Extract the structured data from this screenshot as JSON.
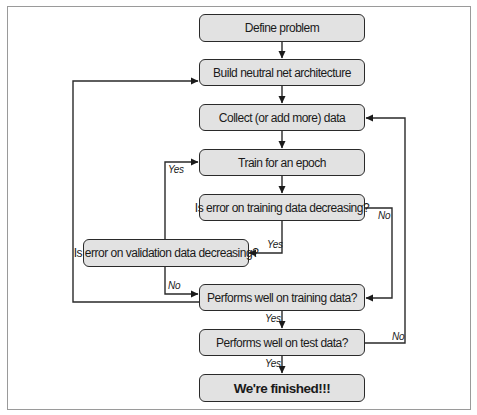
{
  "diagram": {
    "type": "flowchart",
    "nodes": {
      "define": "Define problem",
      "build": "Build neutral net architecture",
      "collect": "Collect (or add more) data",
      "train": "Train for an epoch",
      "train_err": "Is error on training data decreasing?",
      "val_err": "Is error on validation data decreasing?",
      "perf_train": "Performs well on training data?",
      "perf_test": "Performs well on test data?",
      "finished": "We're finished!!!"
    },
    "edge_labels": {
      "train_err_yes": "Yes",
      "train_err_no": "No",
      "val_err_yes": "Yes",
      "val_err_no": "No",
      "perf_train_yes": "Yes",
      "perf_test_yes": "Yes",
      "perf_test_no": "No"
    },
    "edges": [
      {
        "from": "define",
        "to": "build"
      },
      {
        "from": "build",
        "to": "collect"
      },
      {
        "from": "collect",
        "to": "train"
      },
      {
        "from": "train",
        "to": "train_err"
      },
      {
        "from": "train_err",
        "to": "val_err",
        "label": "Yes"
      },
      {
        "from": "train_err",
        "to": "perf_train",
        "label": "No"
      },
      {
        "from": "val_err",
        "to": "train",
        "label": "Yes"
      },
      {
        "from": "val_err",
        "to": "perf_train",
        "label": "No"
      },
      {
        "from": "perf_train",
        "to": "perf_test",
        "label": "Yes"
      },
      {
        "from": "perf_train",
        "to": "build",
        "label": "No"
      },
      {
        "from": "perf_test",
        "to": "finished",
        "label": "Yes"
      },
      {
        "from": "perf_test",
        "to": "collect",
        "label": "No"
      }
    ],
    "colors": {
      "box_fill": "#e2e2e2",
      "stroke": "#2a2a2a",
      "frame": "#9a9a9a"
    }
  }
}
